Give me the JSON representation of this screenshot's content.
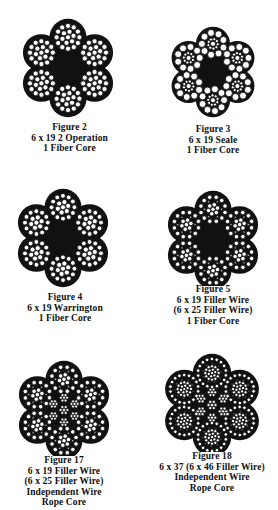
{
  "colors": {
    "ink": "#111111",
    "wire_fill": "#ffffff",
    "background": "#ffffff"
  },
  "figures": [
    {
      "id": "fig2",
      "label": "Figure 2",
      "lines": [
        "6 x 19 2 Operation",
        "1 Fiber Core"
      ],
      "construction": "6x19",
      "core": "fiber",
      "cx": 68,
      "cy": 68,
      "r": 48,
      "caption_x": 68,
      "caption_y": 122
    },
    {
      "id": "fig3",
      "label": "Figure 3",
      "lines": [
        "6 x 19 Seale",
        "1 Fiber Core"
      ],
      "construction": "6x19 Seale",
      "core": "fiber",
      "cx": 213,
      "cy": 72,
      "r": 44,
      "caption_x": 213,
      "caption_y": 124
    },
    {
      "id": "fig4",
      "label": "Figure 4",
      "lines": [
        "6 x 19 Warrington",
        "1 Fiber Core"
      ],
      "construction": "6x19 Warrington",
      "core": "fiber",
      "cx": 63,
      "cy": 238,
      "r": 48,
      "caption_x": 63,
      "caption_y": 292
    },
    {
      "id": "fig5",
      "label": "Figure 5",
      "lines": [
        "6 x 19 Filler Wire",
        "(6 x 25 Filler Wire)",
        "1 Fiber Core"
      ],
      "construction": "6x25 Filler Wire",
      "core": "fiber",
      "cx": 213,
      "cy": 240,
      "r": 48,
      "caption_x": 213,
      "caption_y": 284
    },
    {
      "id": "fig17",
      "label": "Figure 17",
      "lines": [
        "6 x 19 Filler Wire",
        "(6 x 25 Filler Wire)",
        "Independent Wire",
        "Rope Core"
      ],
      "construction": "6x25 Filler Wire",
      "core": "iwrc",
      "cx": 64,
      "cy": 410,
      "r": 48,
      "caption_x": 64,
      "caption_y": 455
    },
    {
      "id": "fig18",
      "label": "Figure 18",
      "lines": [
        "6 x 37 (6 x 46 Filler Wire)",
        "Independent Wire",
        "Rope Core"
      ],
      "construction": "6x46 Filler Wire",
      "core": "iwrc",
      "cx": 212,
      "cy": 405,
      "r": 50,
      "caption_x": 212,
      "caption_y": 451
    }
  ]
}
